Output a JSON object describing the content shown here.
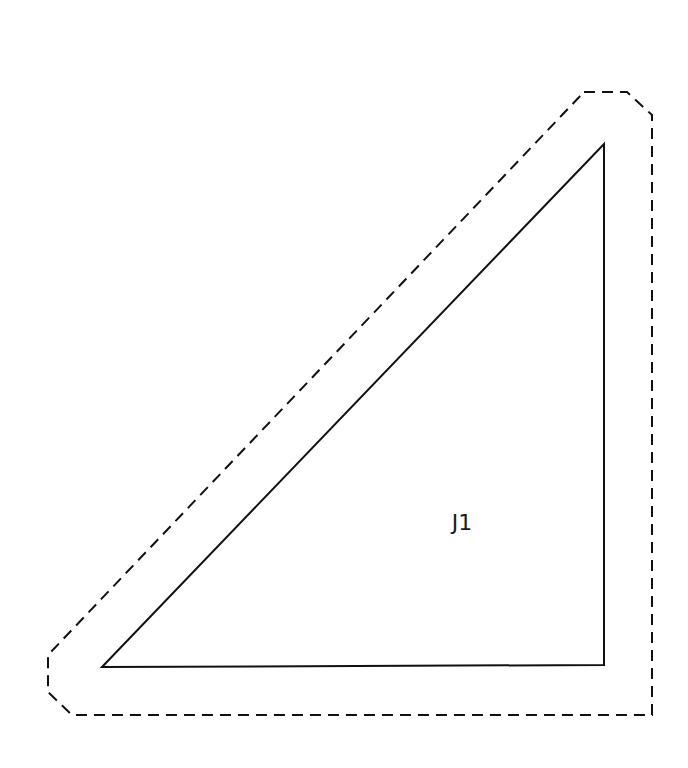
{
  "diagram": {
    "type": "quilt-template",
    "piece_label": "J1",
    "stroke_color": "#111111",
    "background": "#ffffff",
    "triangle": {
      "shape": "right-triangle",
      "points": "102,667 604,144 604,665"
    },
    "seam_allowance_outline": {
      "style": "dashed",
      "points": "584,92 627,92 652,115 652,715 72,715 48,692 48,655"
    },
    "label_position": {
      "x": 462,
      "y": 530
    }
  }
}
